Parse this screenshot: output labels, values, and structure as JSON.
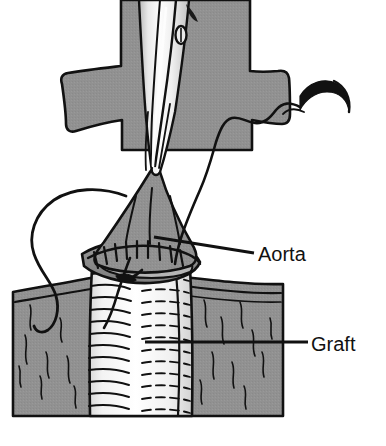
{
  "figure": {
    "type": "medical-line-illustration",
    "canvas": {
      "width": 386,
      "height": 446
    },
    "colors": {
      "background": "#ffffff",
      "tissue_gray": "#919191",
      "tissue_gray_dark": "#828282",
      "outline_black": "#111111",
      "graft_white": "#fbfbfb",
      "instrument_light": "#f2f2f2",
      "instrument_mid": "#cfcfcf",
      "label_text": "#111111"
    }
  },
  "labels": [
    {
      "id": "aorta",
      "text": "Aorta",
      "text_x": 258,
      "text_y": 261,
      "leader": {
        "x1": 154,
        "y1": 237,
        "x2": 254,
        "y2": 253
      },
      "font_size": 20
    },
    {
      "id": "graft",
      "text": "Graft",
      "text_x": 311,
      "text_y": 351,
      "leader": {
        "x1": 145,
        "y1": 342,
        "x2": 308,
        "y2": 342
      },
      "font_size": 20
    }
  ],
  "elements": [
    {
      "name": "aortic-root-tissue",
      "description": "Cross shaped vessel tissue at top"
    },
    {
      "name": "surgical-clamp",
      "description": "Vascular clamp / forceps shaft descending from top"
    },
    {
      "name": "clamp-rivet",
      "description": "Oval hinge pin on the clamp jaw"
    },
    {
      "name": "suture-needle",
      "description": "Curved surgical needle at upper right"
    },
    {
      "name": "suture-thread",
      "description": "Running monofilament thread from needle to anastomosis"
    },
    {
      "name": "suture-loop-left",
      "description": "Large free thread loop at the left side"
    },
    {
      "name": "anastomosis-suture-line",
      "description": "Row of interrupted stitches joining aorta to graft"
    },
    {
      "name": "vascular-graft",
      "description": "Corrugated Dacron tube graft below anastomosis"
    },
    {
      "name": "surrounding-tissue-bed",
      "description": "Gray tissue field filling the lower portion"
    }
  ]
}
